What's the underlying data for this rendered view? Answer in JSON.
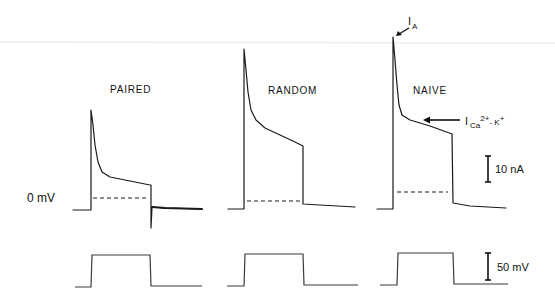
{
  "chart_data": {
    "type": "line",
    "title": "",
    "xlabel": "",
    "ylabel": "",
    "grid": false,
    "legend": null,
    "conditions": [
      "PAIRED",
      "RANDOM",
      "NAIVE"
    ],
    "holding_label": "0 mV",
    "scale_bars": {
      "current": {
        "label": "10 nA",
        "value": 10,
        "unit": "nA",
        "x": 488,
        "y1": 156,
        "y2": 182
      },
      "voltage": {
        "label": "50 mV",
        "value": 50,
        "unit": "mV",
        "x": 488,
        "y1": 253,
        "y2": 280
      }
    },
    "annotations": {
      "ia": {
        "label": "I",
        "sub": "A",
        "text": "IA (transient A-current peak)",
        "arrow": [
          [
            409,
            28
          ],
          [
            397,
            36
          ]
        ]
      },
      "ica": {
        "label": "I",
        "sub": "Ca",
        "sup": "2+",
        "rest": "- K",
        "rest_sup": "+",
        "text": "ICa2+-K+ (calcium-activated potassium current)",
        "arrow": [
          [
            460,
            120
          ],
          [
            424,
            120
          ]
        ]
      }
    },
    "series": [
      {
        "name": "PAIRED",
        "peak_nA": 38,
        "late_nA": 9.5,
        "dashed_level_nA": 4,
        "current_px": [
          [
            73,
            210
          ],
          [
            91,
            210
          ],
          [
            91,
            110
          ],
          [
            93,
            125
          ],
          [
            95,
            145
          ],
          [
            98,
            162
          ],
          [
            102,
            172
          ],
          [
            110,
            177
          ],
          [
            130,
            181
          ],
          [
            150,
            185
          ],
          [
            151,
            185
          ],
          [
            151,
            228
          ],
          [
            152,
            207
          ],
          [
            165,
            208
          ],
          [
            202,
            209
          ]
        ],
        "dashed_px": {
          "x1": 93,
          "x2": 149,
          "y": 198
        },
        "voltage_px": [
          [
            75,
            287
          ],
          [
            91,
            287
          ],
          [
            92,
            255
          ],
          [
            150,
            255
          ],
          [
            151,
            286
          ],
          [
            202,
            286
          ]
        ],
        "label_pos": [
          110,
          93
        ]
      },
      {
        "name": "RANDOM",
        "peak_nA": 61.5,
        "late_nA": 24,
        "dashed_level_nA": 3,
        "current_px": [
          [
            228,
            209
          ],
          [
            244,
            209
          ],
          [
            244,
            49
          ],
          [
            246,
            70
          ],
          [
            248,
            92
          ],
          [
            251,
            110
          ],
          [
            256,
            120
          ],
          [
            265,
            128
          ],
          [
            280,
            135
          ],
          [
            295,
            142
          ],
          [
            303,
            146
          ],
          [
            303,
            204
          ],
          [
            320,
            205
          ],
          [
            355,
            207
          ]
        ],
        "dashed_px": {
          "x1": 247,
          "x2": 300,
          "y": 201
        },
        "voltage_px": [
          [
            227,
            286
          ],
          [
            244,
            286
          ],
          [
            245,
            254
          ],
          [
            303,
            254
          ],
          [
            304,
            285
          ],
          [
            358,
            285
          ]
        ],
        "label_pos": [
          268,
          94
        ]
      },
      {
        "name": "NAIVE",
        "peak_nA": 66,
        "late_nA": 29,
        "dashed_level_nA": 6.5,
        "current_px": [
          [
            377,
            209
          ],
          [
            393,
            209
          ],
          [
            393,
            37
          ],
          [
            395,
            60
          ],
          [
            397,
            85
          ],
          [
            399,
            105
          ],
          [
            402,
            115
          ],
          [
            410,
            120
          ],
          [
            430,
            126
          ],
          [
            452,
            134
          ],
          [
            453,
            203
          ],
          [
            470,
            206
          ],
          [
            506,
            208
          ]
        ],
        "dashed_px": {
          "x1": 397,
          "x2": 448,
          "y": 192
        },
        "voltage_px": [
          [
            380,
            285
          ],
          [
            397,
            285
          ],
          [
            398,
            253
          ],
          [
            453,
            253
          ],
          [
            454,
            284
          ],
          [
            508,
            284
          ]
        ],
        "label_pos": [
          413,
          94
        ]
      }
    ],
    "voltage_step_mV": 50
  }
}
